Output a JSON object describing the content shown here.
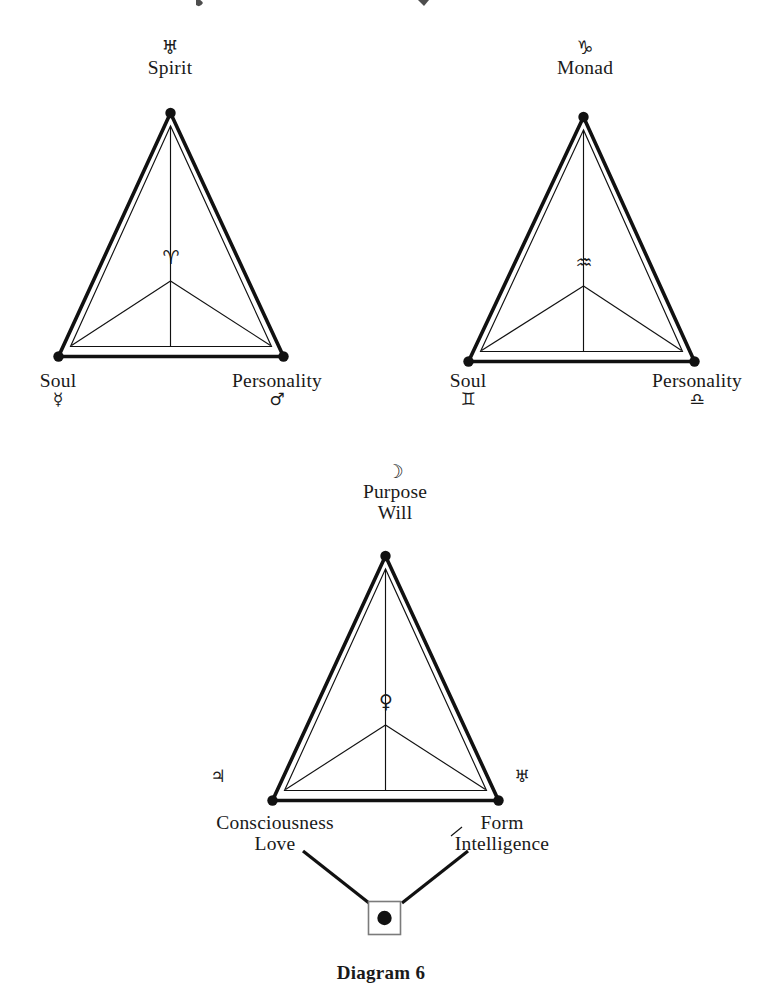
{
  "page": {
    "caption": "Diagram 6",
    "background": "#ffffff",
    "ink": "#1a1a1a"
  },
  "triangles": [
    {
      "id": "spirit-soul-personality",
      "apex": {
        "glyph": "♅",
        "glyph_name": "uranus-symbol",
        "label": "Spirit"
      },
      "bottom_left": {
        "label": "Soul",
        "glyph": "☿",
        "glyph_name": "mercury-symbol"
      },
      "bottom_right": {
        "label": "Personality",
        "glyph": "♂",
        "glyph_name": "mars-symbol"
      },
      "center": {
        "glyph": "♈",
        "glyph_name": "aries-symbol"
      }
    },
    {
      "id": "monad-soul-personality",
      "apex": {
        "glyph": "♑",
        "glyph_name": "capricorn-symbol",
        "label": "Monad"
      },
      "bottom_left": {
        "label": "Soul",
        "glyph": "♊",
        "glyph_name": "gemini-symbol"
      },
      "bottom_right": {
        "label": "Personality",
        "glyph": "♎",
        "glyph_name": "libra-symbol"
      },
      "center": {
        "glyph": "♒",
        "glyph_name": "aquarius-symbol"
      }
    },
    {
      "id": "purpose-consciousness-form",
      "apex": {
        "glyph": "☽",
        "glyph_name": "moon-symbol",
        "label_line1": "Purpose",
        "label_line2": "Will"
      },
      "bottom_left": {
        "glyph": "♃",
        "glyph_name": "jupiter-symbol",
        "label_line1": "Consciousness",
        "label_line2": "Love"
      },
      "bottom_right": {
        "glyph": "♅",
        "glyph_name": "uranus-symbol",
        "label_line1": "Form",
        "label_line2": "Intelligence"
      },
      "center": {
        "glyph": "♀",
        "glyph_name": "venus-symbol"
      },
      "footer_node": {
        "glyph_name": "square-with-dot-symbol"
      }
    }
  ]
}
